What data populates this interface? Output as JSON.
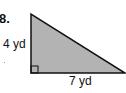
{
  "problem": {
    "number": "8.",
    "shape": "right-triangle",
    "vertical_leg_label": "4 yd",
    "horizontal_leg_label": "7 yd",
    "right_angle_marker": "bottom-left",
    "fill_color": "#b3b3b3",
    "stroke_color": "#111111"
  }
}
